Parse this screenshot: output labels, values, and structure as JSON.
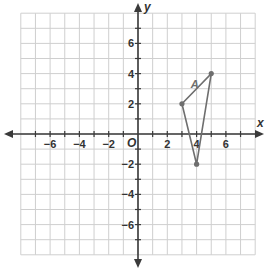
{
  "graph": {
    "x_axis_label": "x",
    "y_axis_label": "y",
    "origin_label": "O",
    "x_range": [
      -8,
      8
    ],
    "y_range": [
      -8,
      8
    ],
    "grid_step": 1,
    "x_tick_labels": [
      {
        "value": -6,
        "label": "−6"
      },
      {
        "value": -4,
        "label": "−4"
      },
      {
        "value": -2,
        "label": "−2"
      },
      {
        "value": 2,
        "label": "2"
      },
      {
        "value": 4,
        "label": "4"
      },
      {
        "value": 6,
        "label": "6"
      }
    ],
    "y_tick_labels": [
      {
        "value": 6,
        "label": "6"
      },
      {
        "value": 4,
        "label": "4"
      },
      {
        "value": 2,
        "label": "2"
      },
      {
        "value": -2,
        "label": "−2"
      },
      {
        "value": -4,
        "label": "−4"
      },
      {
        "value": -6,
        "label": "−6"
      }
    ],
    "figure": {
      "label": "A",
      "vertices": [
        [
          3,
          2
        ],
        [
          5,
          4
        ],
        [
          4,
          -2
        ]
      ],
      "color": "#6e6e6e"
    },
    "colors": {
      "grid": "#cfcfcf",
      "axis": "#3a3a3a",
      "background": "#ffffff"
    }
  }
}
